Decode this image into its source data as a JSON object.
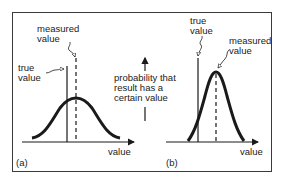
{
  "figure": {
    "panel_a": {
      "tag": "(a)",
      "axis_label": "value",
      "true_label_line1": "true",
      "true_label_line2": "value",
      "measured_label_line1": "measured",
      "measured_label_line2": "value",
      "curve": "wide normal distribution centred on measured value"
    },
    "panel_b": {
      "tag": "(b)",
      "axis_label": "value",
      "true_label_line1": "true",
      "true_label_line2": "value",
      "measured_label_line1": "measured",
      "measured_label_line2": "value",
      "curve": "narrow normal distribution centred on measured value"
    },
    "y_axis_caption": {
      "line1": "probability that",
      "line2": "result has a",
      "line3": "certain value"
    }
  },
  "colors": {
    "ink": "#1a1a1a",
    "frame": "#3a3a3a",
    "background": "#ffffff"
  }
}
